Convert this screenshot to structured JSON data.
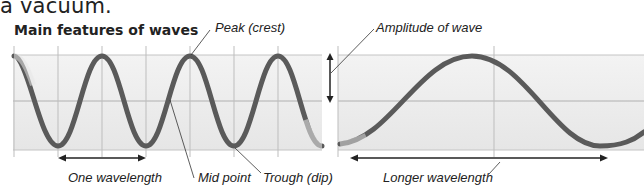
{
  "intro_text": "a vacuum.",
  "title": "Main features of waves",
  "labels": {
    "peak": "Peak (crest)",
    "amplitude": "Amplitude of wave",
    "one_wavelength": "One wavelength",
    "mid_point": "Mid point",
    "trough": "Trough (dip)",
    "longer_wavelength": "Longer wavelength"
  },
  "colors": {
    "wave": "#5a5a5a",
    "band": "#ececec",
    "grid": "#b8b8b8",
    "arrow": "#222222",
    "text": "#222222"
  },
  "panels": [
    {
      "name": "short-wavelength-wave",
      "wavelength_px": 88,
      "cycles_shown": 3.5
    },
    {
      "name": "long-wavelength-wave",
      "wavelength_px": 262,
      "cycles_shown": 1.2
    }
  ]
}
